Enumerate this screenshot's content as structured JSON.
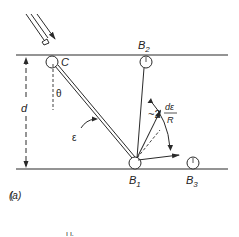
{
  "figure": {
    "panel_label": "(a)",
    "labels": {
      "contact_point": "C",
      "bounce_1": "B",
      "bounce_1_sub": "1",
      "bounce_2": "B",
      "bounce_2_sub": "2",
      "bounce_3": "B",
      "bounce_3_sub": "3",
      "separation": "d",
      "theta": "θ",
      "epsilon": "ε",
      "angle_prefix": "~2",
      "angle_numerator": "dε",
      "angle_denominator": "R"
    },
    "colors": {
      "stroke": "#2a2a2a",
      "background": "#ffffff"
    },
    "fragment_text": "ı ı."
  }
}
